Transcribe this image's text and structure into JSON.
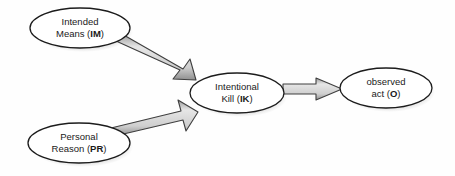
{
  "diagram": {
    "type": "flow-diagram",
    "background_color": "#fefefe",
    "node_fill_color": "#ffffff",
    "node_stroke_color": "#1c1c1c",
    "arrow_fill_color": "#d8d8d8",
    "arrow_stroke_color": "#3a3a3a",
    "text_color": "#1a1a1a",
    "nodes": [
      {
        "id": "IM",
        "name": "intended-means-node",
        "line1": "Intended",
        "line2_prefix": "Means (",
        "line2_bold": "IM",
        "line2_suffix": ")",
        "cx": 80,
        "cy": 28,
        "rx": 50,
        "ry": 20
      },
      {
        "id": "PR",
        "name": "personal-reason-node",
        "line1": "Personal",
        "line2_prefix": "Reason (",
        "line2_bold": "PR",
        "line2_suffix": ")",
        "cx": 79,
        "cy": 143,
        "rx": 51,
        "ry": 20
      },
      {
        "id": "IK",
        "name": "intentional-kill-node",
        "line1": "Intentional",
        "line2_prefix": "Kill (",
        "line2_bold": "IK",
        "line2_suffix": ")",
        "cx": 237,
        "cy": 93,
        "rx": 47,
        "ry": 20
      },
      {
        "id": "O",
        "name": "observed-act-node",
        "line1": "observed",
        "line2_prefix": "act (",
        "line2_bold": "O",
        "line2_suffix": ")",
        "cx": 386,
        "cy": 88,
        "rx": 46,
        "ry": 20
      }
    ],
    "edges": [
      {
        "id": "IM-IK",
        "name": "arrow-intended-means-to-intentional-kill",
        "from": "IM",
        "to": "IK",
        "direction": "down-right"
      },
      {
        "id": "PR-IK",
        "name": "arrow-personal-reason-to-intentional-kill",
        "from": "PR",
        "to": "IK",
        "direction": "up-right"
      },
      {
        "id": "IK-O",
        "name": "arrow-intentional-kill-to-observed-act",
        "from": "IK",
        "to": "O",
        "direction": "right"
      }
    ]
  }
}
